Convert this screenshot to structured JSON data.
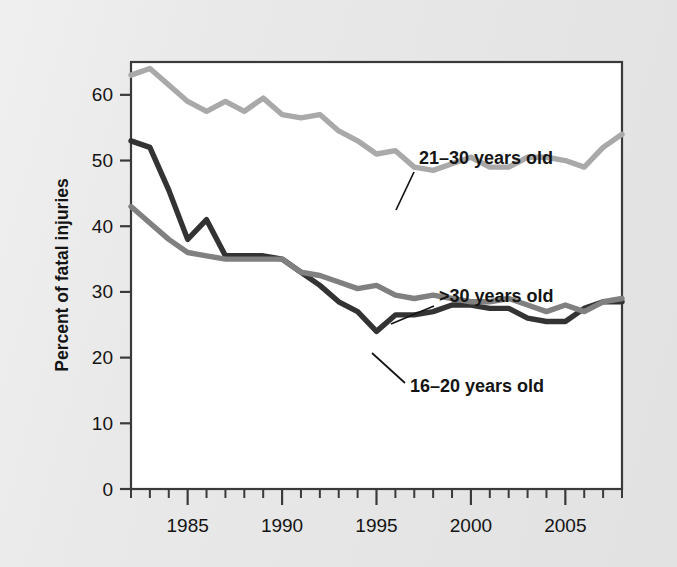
{
  "chart_data": {
    "type": "line",
    "title": "",
    "xlabel": "",
    "ylabel": "Percent of fatal injuries",
    "xlim": [
      1982,
      2008
    ],
    "ylim": [
      0,
      65
    ],
    "yticks": [
      0,
      10,
      20,
      30,
      40,
      50,
      60
    ],
    "ytick_labels": [
      "0",
      "10",
      "20",
      "30",
      "40",
      "50",
      "60"
    ],
    "xticks": [
      1985,
      1990,
      1995,
      2000,
      2005
    ],
    "xtick_labels": [
      "1985",
      "1990",
      "1995",
      "2000",
      "2005"
    ],
    "x_minor_tick_interval": 1,
    "grid": false,
    "legend_position": "inline-annotations",
    "x": [
      1982,
      1983,
      1984,
      1985,
      1986,
      1987,
      1988,
      1989,
      1990,
      1991,
      1992,
      1993,
      1994,
      1995,
      1996,
      1997,
      1998,
      1999,
      2000,
      2001,
      2002,
      2003,
      2004,
      2005,
      2006,
      2007,
      2008
    ],
    "series": [
      {
        "name": "21-30 years old",
        "label": "21–30 years old",
        "color": "#a9a9a9",
        "values": [
          63.0,
          64.0,
          61.5,
          59.0,
          57.5,
          59.0,
          57.5,
          59.5,
          57.0,
          56.5,
          57.0,
          54.5,
          53.0,
          51.0,
          51.5,
          49.0,
          48.5,
          49.5,
          50.5,
          49.0,
          49.0,
          50.5,
          50.5,
          50.0,
          49.0,
          52.0,
          54.0
        ]
      },
      {
        "name": "16-20 years old",
        "label": "16–20 years old",
        "color": "#333333",
        "values": [
          53.0,
          52.0,
          45.5,
          38.0,
          41.0,
          35.5,
          35.5,
          35.5,
          35.0,
          33.0,
          31.0,
          28.5,
          27.0,
          24.0,
          26.5,
          26.5,
          27.0,
          28.0,
          28.0,
          27.5,
          27.5,
          26.0,
          25.5,
          25.5,
          27.5,
          28.5,
          28.5
        ]
      },
      {
        "name": ">30 years old",
        "label": ">30 years old",
        "color": "#808080",
        "values": [
          43.0,
          40.5,
          38.0,
          36.0,
          35.5,
          35.0,
          35.0,
          35.0,
          35.0,
          33.0,
          32.5,
          31.5,
          30.5,
          31.0,
          29.5,
          29.0,
          29.5,
          29.0,
          28.5,
          28.5,
          29.0,
          28.0,
          27.0,
          28.0,
          27.0,
          28.5,
          29.0
        ]
      }
    ],
    "annotations": [
      {
        "name": "annotation-21-30",
        "text": "21–30 years old",
        "text_x": 419,
        "text_y": 164,
        "leader_from_x": 414,
        "leader_from_y": 172,
        "leader_to_x": 396,
        "leader_to_y": 210
      },
      {
        "name": "annotation-over-30",
        "text": ">30 years old",
        "text_x": 439,
        "text_y": 302,
        "leader_from_x": 434,
        "leader_from_y": 306,
        "leader_to_x": 391,
        "leader_to_y": 324
      },
      {
        "name": "annotation-16-20",
        "text": "16–20 years old",
        "text_x": 410,
        "text_y": 392,
        "leader_from_x": 405,
        "leader_from_y": 383,
        "leader_to_x": 372,
        "leader_to_y": 353
      }
    ],
    "colors": {
      "background": "#e9e9e9",
      "plot_background": "#ffffff",
      "axis": "#3a3a3a",
      "text": "#1a1a1a"
    }
  }
}
